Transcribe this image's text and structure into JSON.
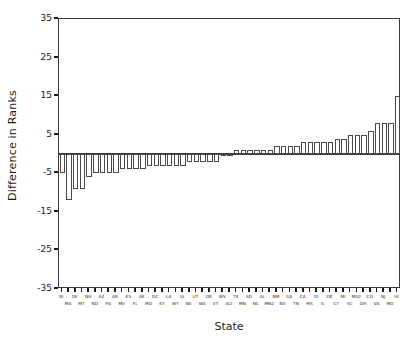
{
  "chart_data": {
    "type": "bar",
    "title": "",
    "xlabel": "State",
    "ylabel": "Difference in Ranks",
    "ylim": [
      -35,
      35
    ],
    "yticks": [
      35,
      25,
      15,
      5,
      -5,
      -15,
      -25,
      -35
    ],
    "grid": false,
    "legend": null,
    "orientation": "vertical",
    "bar_style": {
      "fill": "#ffffff",
      "edge": "#4a4a4a"
    },
    "categories": [
      "RI",
      "MA",
      "DE",
      "MT",
      "NH",
      "ND",
      "AZ",
      "PA",
      "AR",
      "ME",
      "KS",
      "FL",
      "AK",
      "MO",
      "DC",
      "KY",
      "LA",
      "WY",
      "IA",
      "NE",
      "UT",
      "WA",
      "OR",
      "VT",
      "WV",
      "IA2",
      "TX",
      "MN",
      "SD",
      "NC",
      "AL",
      "MN2",
      "NM",
      "NV",
      "GA",
      "TN",
      "CA",
      "MS",
      "ID",
      "IL",
      "OK",
      "CT",
      "MI",
      "SC",
      "MS2",
      "OH",
      "CO",
      "VA",
      "NJ",
      "MD",
      "HI"
    ],
    "categories_row0": [
      "RI",
      "DE",
      "NH",
      "AZ",
      "AR",
      "KS",
      "AK",
      "DC",
      "LA",
      "IA",
      "UT",
      "OR",
      "WV",
      "TX",
      "SD",
      "AL",
      "NM",
      "GA",
      "CA",
      "ID",
      "OK",
      "MI",
      "MS",
      "CO",
      "NJ",
      "HI"
    ],
    "categories_row1": [
      "MA",
      "MT",
      "ND",
      "PA",
      "ME",
      "FL",
      "MO",
      "KY",
      "WY",
      "NE",
      "WA",
      "VT",
      "IA",
      "MN",
      "NC",
      "MN",
      "NV",
      "TN",
      "MS",
      "IL",
      "CT",
      "SC",
      "OH",
      "VA",
      "MD"
    ],
    "values": [
      -5,
      -12,
      -9,
      -9,
      -6,
      -5,
      -5,
      -5,
      -5,
      -4,
      -4,
      -4,
      -4,
      -3,
      -3,
      -3,
      -3,
      -3,
      -3,
      -2,
      -2,
      -2,
      -2,
      -2,
      0,
      0,
      1,
      1,
      1,
      1,
      1,
      1,
      2,
      2,
      2,
      2,
      3,
      3,
      3,
      3,
      3,
      4,
      4,
      5,
      5,
      5,
      6,
      8,
      8,
      8,
      15
    ]
  },
  "axes": {
    "ylabel": "Difference in Ranks",
    "xlabel": "State",
    "ytick_labels": [
      "35",
      "25",
      "15",
      "5",
      "-5",
      "-15",
      "-25",
      "-35"
    ]
  }
}
